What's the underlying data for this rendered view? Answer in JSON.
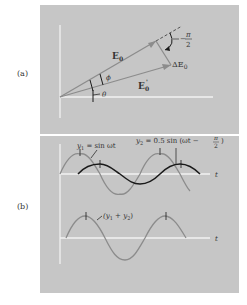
{
  "figure": {
    "panel_a": {
      "label": "(a)",
      "vectors": {
        "E0": "E",
        "E0_sub": "0",
        "E0_prime": "E",
        "E0_prime_sub": "0",
        "E0_prime_sup": "'",
        "delta_E0": "ΔE",
        "delta_E0_sub": "0"
      },
      "angles": {
        "phi": "ϕ",
        "theta": "θ",
        "right_angle_num": "π",
        "right_angle_den": "2",
        "right_angle_sign": "−"
      }
    },
    "panel_b": {
      "label": "(b)",
      "y1_label": "y",
      "y1_sub": "1",
      "y1_eq": " = sin ωt",
      "y2_label": "y",
      "y2_sub": "2",
      "y2_eq": " = 0.5 sin (ωt − ",
      "y2_frac_num": "π",
      "y2_frac_den": "2",
      "y2_close": ")",
      "sum_label": "(y",
      "sum_sub1": "1",
      "sum_mid": " + y",
      "sum_sub2": "2",
      "sum_close": ")",
      "t_axis_top": "t",
      "t_axis_bottom": "t"
    },
    "colors": {
      "panel_bg": "#c6c6c6",
      "axis": "#f2f2f2",
      "gray_curve": "#8c8c8c",
      "dark_curve": "#1a1a1a",
      "text": "#333333"
    }
  }
}
